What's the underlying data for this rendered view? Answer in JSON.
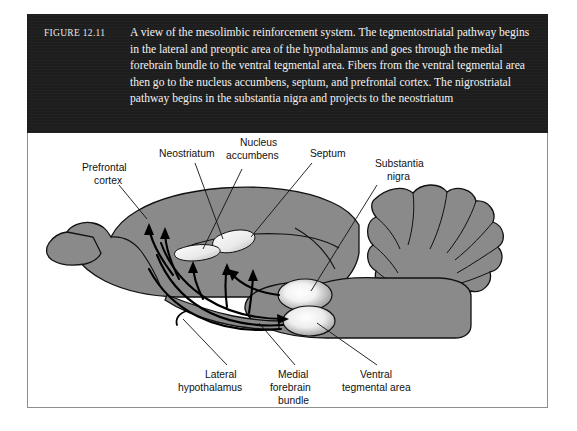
{
  "figure": {
    "number_label": "FIGURE 12.11",
    "caption": "A view of the mesolimbic reinforcement system. The tegmentostriatal pathway begins in the lateral and preoptic area of the hypothalamus and goes through the medial forebrain bundle to the ventral tegmental area. Fibers from the ventral tegmental area then go to the nucleus accumbens, septum, and prefrontal cortex. The nigrostriatal pathway begins in the substantia nigra and projects to the neostriatum",
    "banner_background": "#1d1d1d",
    "banner_text_color": "#f2f2f2",
    "frame_border_color": "#8e8e8e"
  },
  "diagram": {
    "brain_fill": "#8a8a8a",
    "brain_outline": "#111111",
    "nucleus_highlight": "#ffffff",
    "pathway_color": "#000000",
    "labels": {
      "prefrontal_cortex_line1": "Prefrontal",
      "prefrontal_cortex_line2": "cortex",
      "neostriatum": "Neostriatum",
      "nucleus_accumbens_line1": "Nucleus",
      "nucleus_accumbens_line2": "accumbens",
      "septum": "Septum",
      "substantia_nigra_line1": "Substantia",
      "substantia_nigra_line2": "nigra",
      "lateral_hypothalamus_line1": "Lateral",
      "lateral_hypothalamus_line2": "hypothalamus",
      "medial_forebrain_bundle_line1": "Medial",
      "medial_forebrain_bundle_line2": "forebrain",
      "medial_forebrain_bundle_line3": "bundle",
      "ventral_tegmental_area_line1": "Ventral",
      "ventral_tegmental_area_line2": "tegmental area"
    }
  }
}
